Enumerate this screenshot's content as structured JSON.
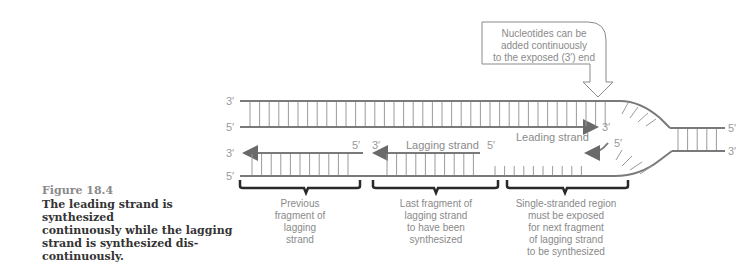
{
  "caption": {
    "figure_number": "Figure 18.4",
    "lines": [
      "The leading strand is synthesized",
      "continuously while the lagging",
      "strand is synthesized dis-",
      "continuously."
    ]
  },
  "callout": {
    "lines": [
      "Nucleotides can be",
      "added continuously",
      "to the exposed (3′) end"
    ]
  },
  "strand_ends": {
    "top_left_upper": "3′",
    "top_left_lower": "5′",
    "bottom_left_upper": "3′",
    "bottom_left_lower": "5′",
    "right_upper": "5′",
    "right_lower": "3′",
    "leading_tip": "3′",
    "fragment_prev_5": "5′",
    "fragment_last_3": "3′",
    "fragment_last_5": "5′",
    "new_fragment_5": "5′"
  },
  "strand_labels": {
    "leading": "Leading strand",
    "lagging": "Lagging strand"
  },
  "brackets": [
    {
      "lines": [
        "Previous",
        "fragment of",
        "lagging",
        "strand"
      ]
    },
    {
      "lines": [
        "Last fragment of",
        "lagging strand",
        "to have been",
        "synthesized"
      ]
    },
    {
      "lines": [
        "Single-stranded region",
        "must be exposed",
        "for next fragment",
        "of lagging strand",
        "to be synthesized"
      ]
    }
  ],
  "colors": {
    "strand": "#7a7a7a",
    "bracket": "#2a2a2a",
    "text": "#8a8a8a"
  }
}
